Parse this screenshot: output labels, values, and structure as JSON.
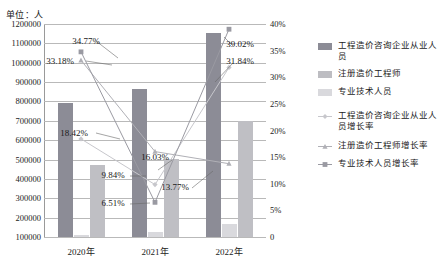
{
  "unit_label": "单位：人",
  "legend": {
    "items": [
      {
        "label": "工程造价咨询企业从业人员",
        "marker": "bar-swatch-dark",
        "color": "#8c8c96"
      },
      {
        "label": "注册造价工程师",
        "marker": "bar-swatch-mid",
        "color": "#bdbdc2"
      },
      {
        "label": "专业技术人员",
        "marker": "bar-swatch-light",
        "color": "#d9d9dd"
      },
      {
        "label": "工程造价咨询企业从业人员增长率",
        "marker": "line-diamond-icon",
        "color": "#c7c7cc"
      },
      {
        "label": "注册造价工程师增长率",
        "marker": "line-triangle-icon",
        "color": "#b0b0b6"
      },
      {
        "label": "专业技术人员增长率",
        "marker": "line-square-icon",
        "color": "#9a9aa2"
      }
    ]
  },
  "chart_data": {
    "type": "bar",
    "title": "",
    "xlabel": "",
    "ylabel": "单位：人",
    "categories": [
      "2020年",
      "2021年",
      "2022年"
    ],
    "ylim": [
      100000,
      1200000
    ],
    "y_ticks": [
      "1200000",
      "1100000",
      "1000000",
      "900000",
      "800000",
      "700000",
      "600000",
      "500000",
      "400000",
      "300000",
      "200000",
      "100000"
    ],
    "y2lim": [
      0,
      40
    ],
    "y2_ticks": [
      "40%",
      "35%",
      "30%",
      "25%",
      "20%",
      "15%",
      "10%",
      "5%",
      "0"
    ],
    "grid": true,
    "legend_position": "right",
    "series": [
      {
        "name": "工程造价咨询企业从业人员",
        "type": "bar",
        "axis": "left",
        "color": "#8c8c96",
        "values": [
          790000,
          865000,
          1152000
        ]
      },
      {
        "name": "注册造价工程师",
        "type": "bar",
        "axis": "left",
        "color": "#d9d9dd",
        "values": [
          108000,
          128000,
          168000
        ]
      },
      {
        "name": "专业技术人员",
        "type": "bar",
        "axis": "left",
        "color": "#bfbfc4",
        "values": [
          472000,
          503000,
          700000
        ]
      },
      {
        "name": "工程造价咨询企业从业人员增长率",
        "type": "line",
        "axis": "right",
        "color": "#c7c7cc",
        "values": [
          18.42,
          9.84,
          31.84
        ],
        "labels": [
          "18.42%",
          "9.84%",
          "31.84%"
        ]
      },
      {
        "name": "注册造价工程师增长率",
        "type": "line",
        "axis": "right",
        "color": "#b0b0b6",
        "values": [
          33.18,
          16.03,
          13.77
        ],
        "labels": [
          "33.18%",
          "16.03%",
          "13.77%"
        ]
      },
      {
        "name": "专业技术人员增长率",
        "type": "line",
        "axis": "right",
        "color": "#9a9aa2",
        "values": [
          34.77,
          6.51,
          39.02
        ],
        "labels": [
          "34.77%",
          "6.51%",
          "39.02%"
        ]
      }
    ],
    "annotations": [
      {
        "text": "34.77%",
        "x": 86,
        "y": 41
      },
      {
        "text": "33.18%",
        "x": 60,
        "y": 61
      },
      {
        "text": "18.42%",
        "x": 74,
        "y": 133
      },
      {
        "text": "9.84%",
        "x": 113,
        "y": 175
      },
      {
        "text": "6.51%",
        "x": 113,
        "y": 203
      },
      {
        "text": "16.03%",
        "x": 155,
        "y": 157
      },
      {
        "text": "13.77%",
        "x": 175,
        "y": 187
      },
      {
        "text": "39.02%",
        "x": 240,
        "y": 44
      },
      {
        "text": "31.84%",
        "x": 240,
        "y": 61
      }
    ]
  }
}
